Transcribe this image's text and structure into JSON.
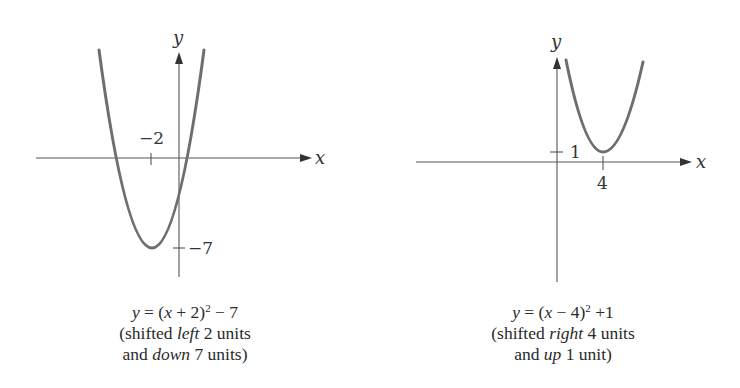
{
  "figure": {
    "panels": [
      {
        "id": "left",
        "equation": {
          "y": "y",
          "eq": " = (",
          "x": "x",
          "inner": " + 2)",
          "exp": "2",
          "tail": " − 7"
        },
        "caption_line2": {
          "pre": "(shifted ",
          "em": "left",
          "post": " 2 units"
        },
        "caption_line3": {
          "pre": "and ",
          "em": "down",
          "post": " 7 units)"
        },
        "axis_labels": {
          "x": "x",
          "y": "y"
        },
        "tick_labels": {
          "x_tick": "−2",
          "y_tick": "−7"
        }
      },
      {
        "id": "right",
        "equation": {
          "y": "y",
          "eq": " = (",
          "x": "x",
          "inner": " − 4)",
          "exp": "2",
          "tail": " +1"
        },
        "caption_line2": {
          "pre": "(shifted ",
          "em": "right",
          "post": " 4 units"
        },
        "caption_line3": {
          "pre": "and ",
          "em": "up",
          "post": " 1 unit)"
        },
        "axis_labels": {
          "x": "x",
          "y": "y"
        },
        "tick_labels": {
          "x_tick": "4",
          "y_tick": "1"
        }
      }
    ],
    "colors": {
      "axis": "#555555",
      "curve": "#6e6e6e",
      "text": "#2a2a2a"
    }
  }
}
